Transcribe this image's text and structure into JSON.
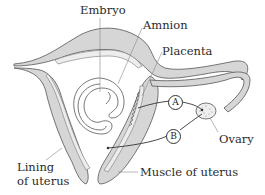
{
  "diagram": {
    "labels": {
      "embryo": "Embryo",
      "amnion": "Amnion",
      "placenta": "Placenta",
      "ovary": "Ovary",
      "lining_line1": "Lining",
      "lining_line2": "of uterus",
      "muscle": "Muscle of uterus"
    },
    "markers": {
      "a": "A",
      "b": "B"
    },
    "colors": {
      "muscle_fill": "#d6d6d6",
      "lining_fill": "#ececec",
      "outline": "#555555",
      "leader": "#888888",
      "arrow": "#333333"
    }
  }
}
